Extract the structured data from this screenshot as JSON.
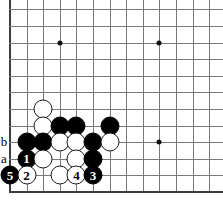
{
  "figure": {
    "kind": "go-board-diagram",
    "width": 223,
    "height": 206,
    "background_color": "#ffffff",
    "line_color": "#7a7a7a",
    "edge_color": "#3d3d3d",
    "black_color": "#000000",
    "white_color": "#ffffff"
  },
  "board": {
    "origin_x": 10,
    "origin_y": 192,
    "spacing": 16.6,
    "columns": 13,
    "rows": 12,
    "left_edge_column": 0,
    "bottom_edge_row": 0,
    "star_points": [
      {
        "col": 3,
        "row": 9
      },
      {
        "col": 9,
        "row": 9
      },
      {
        "col": 9,
        "row": 3
      }
    ]
  },
  "stones": [
    {
      "col": 2,
      "row": 5,
      "color": "white",
      "label": ""
    },
    {
      "col": 2,
      "row": 4,
      "color": "white",
      "label": ""
    },
    {
      "col": 3,
      "row": 4,
      "color": "black",
      "label": ""
    },
    {
      "col": 4,
      "row": 4,
      "color": "black",
      "label": ""
    },
    {
      "col": 6,
      "row": 4,
      "color": "black",
      "label": ""
    },
    {
      "col": 1,
      "row": 3,
      "color": "black",
      "label": ""
    },
    {
      "col": 2,
      "row": 3,
      "color": "black",
      "label": ""
    },
    {
      "col": 3,
      "row": 3,
      "color": "white",
      "label": ""
    },
    {
      "col": 4,
      "row": 3,
      "color": "white",
      "label": ""
    },
    {
      "col": 5,
      "row": 3,
      "color": "black",
      "label": ""
    },
    {
      "col": 6,
      "row": 3,
      "color": "white",
      "label": ""
    },
    {
      "col": 1,
      "row": 2,
      "color": "black",
      "label": "1"
    },
    {
      "col": 2,
      "row": 2,
      "color": "white",
      "label": ""
    },
    {
      "col": 4,
      "row": 2,
      "color": "white",
      "label": ""
    },
    {
      "col": 5,
      "row": 2,
      "color": "black",
      "label": ""
    },
    {
      "col": 0,
      "row": 1,
      "color": "black",
      "label": "5"
    },
    {
      "col": 1,
      "row": 1,
      "color": "white",
      "label": "2"
    },
    {
      "col": 3,
      "row": 1,
      "color": "white",
      "label": ""
    },
    {
      "col": 4,
      "row": 1,
      "color": "white",
      "label": "4"
    },
    {
      "col": 5,
      "row": 1,
      "color": "black",
      "label": "3"
    }
  ],
  "coordinate_labels": [
    {
      "text": "b",
      "col": 0,
      "row": 3
    },
    {
      "text": "a",
      "col": 0,
      "row": 2
    }
  ]
}
